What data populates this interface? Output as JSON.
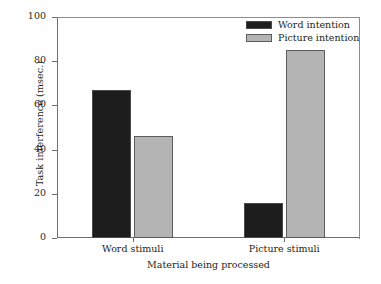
{
  "chart_data": {
    "type": "bar",
    "title": "",
    "xlabel": "Material being processed",
    "ylabel": "Task interference (msec.)",
    "categories": [
      "Word stimuli",
      "Picture stimuli"
    ],
    "series": [
      {
        "name": "Word intention",
        "values": [
          67,
          16
        ],
        "color": "#1d1d1d"
      },
      {
        "name": "Picture intention",
        "values": [
          46,
          85
        ],
        "color": "#b4b4b4"
      }
    ],
    "ylim": [
      0,
      100
    ],
    "yticks": [
      0,
      20,
      40,
      60,
      80,
      100
    ],
    "ytick_labels": [
      "0",
      "20",
      "40",
      "60",
      "80",
      "100"
    ],
    "grid": false,
    "legend_position": "top-right",
    "axis_color": "#6e6e6e",
    "text_color": "#231f20",
    "background": "#ffffff"
  },
  "legend": {
    "entries": [
      {
        "label": "Word intention",
        "swatch": "word"
      },
      {
        "label": "Picture intention",
        "swatch": "picture"
      }
    ]
  },
  "axes": {
    "y_title": "Task interference (msec.)",
    "x_title": "Material being processed",
    "y_tick_0": "0",
    "y_tick_1": "20",
    "y_tick_2": "40",
    "y_tick_3": "60",
    "y_tick_4": "80",
    "y_tick_5": "100",
    "x_cat_0": "Word stimuli",
    "x_cat_1": "Picture stimuli"
  }
}
